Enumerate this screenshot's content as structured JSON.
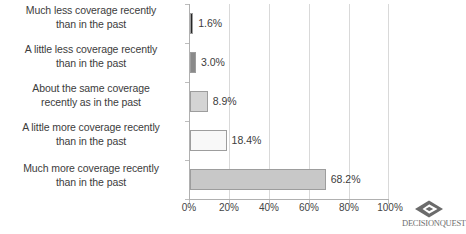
{
  "chart_data": {
    "type": "bar",
    "orientation": "horizontal",
    "title": "",
    "xlabel": "",
    "ylabel": "",
    "categories": [
      "Much less coverage recently than in the past",
      "A little less coverage recently than in the past",
      "About the same coverage recently as in the past",
      "A little more coverage recently than in the past",
      "Much more coverage recently than in the past"
    ],
    "category_lines": [
      [
        "Much less coverage recently",
        "than in the past"
      ],
      [
        "A little less coverage recently",
        "than in the past"
      ],
      [
        "About the same coverage",
        "recently as in the past"
      ],
      [
        "A little more coverage recently",
        "than in the past"
      ],
      [
        "Much more coverage recently",
        "than in the past"
      ]
    ],
    "values": [
      1.6,
      3.0,
      8.9,
      18.4,
      68.2
    ],
    "value_labels": [
      "1.6%",
      "3.0%",
      "8.9%",
      "18.4%",
      "68.2%"
    ],
    "bar_colors": [
      "#262626",
      "#8a8a8a",
      "#d4d4d4",
      "#f8f8f8",
      "#c8c8c8"
    ],
    "bar_border_color": "#9d9d9d",
    "xlim": [
      0,
      100
    ],
    "xticks": [
      0,
      20,
      40,
      60,
      80,
      100
    ],
    "xtick_labels": [
      "0%",
      "20%",
      "40%",
      "60%",
      "80%",
      "100%"
    ],
    "grid": true,
    "grid_axis": "x",
    "legend": false,
    "background": "#ffffff",
    "text_color": "#3c3c3c"
  },
  "logo": {
    "name": "decisionquest-logo",
    "wordmark": "DECISIONQUEST",
    "mark_color": "#6b6b6b"
  }
}
